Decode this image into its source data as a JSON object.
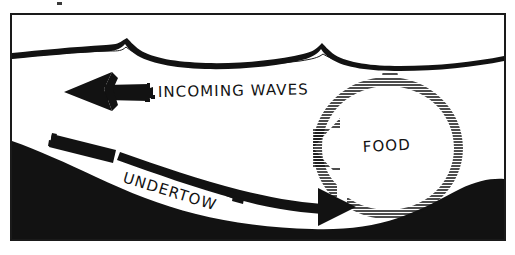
{
  "figure": {
    "medium": "black-and-white pen-and-ink line drawing",
    "background_color": "#ffffff",
    "ink_color": "#121212",
    "frame": {
      "name": "illustration-border",
      "style": "thin black rectangle outline",
      "x": 10,
      "y": 13,
      "width": 496,
      "height": 228,
      "stroke_color": "#1a1a1a",
      "stroke_width": 2
    },
    "speck": {
      "name": "scan-speck",
      "x": 57,
      "y": 2,
      "width": 5,
      "height": 3
    }
  },
  "labels": {
    "incoming_waves": "INCOMING WAVES",
    "undertow": "UNDERTOW",
    "food": "FOOD"
  },
  "label_positions": {
    "incoming_waves": {
      "x": 158,
      "y": 97,
      "rotation": -1,
      "font_size": 15
    },
    "undertow": {
      "x": 122,
      "y": 182,
      "rotation": 17,
      "font_size": 15
    },
    "food": {
      "x": 363,
      "y": 152,
      "rotation": -3,
      "font_size": 15
    }
  },
  "elements": {
    "water_surface": {
      "name": "water-surface-waves",
      "description": "Two peaked wave crests drawn as a heavy black brush line with a thin trailing line beneath",
      "crest_count": 2,
      "crest_x_positions": [
        125,
        322
      ],
      "baseline_y": 55,
      "color": "#121212"
    },
    "seabed": {
      "name": "seabed-silhouette",
      "description": "Solid black ocean floor sloping down from the left, dipping to a trough, then rising on the right",
      "fill_color": "#121212",
      "left_top_y": 142,
      "trough_y": 228,
      "right_rise_y": 188
    },
    "incoming_waves_arrow": {
      "name": "incoming-waves-arrow",
      "direction": "left",
      "description": "Thick black brush arrow pointing left, ragged tail",
      "tip_x": 66,
      "tail_x": 152,
      "y": 92,
      "color": "#121212"
    },
    "undertow_arrow": {
      "name": "undertow-arrow",
      "direction": "right",
      "description": "Long curving black brush arrow running along the seabed from upper-left to a solid triangular head at right",
      "tail_x": 52,
      "tip_x": 352,
      "tail_y": 138,
      "tip_y": 207,
      "color": "#121212"
    },
    "food_eddy": {
      "name": "food-eddy-hatching",
      "description": "Circulating ring drawn as stacked horizontal hatch strokes, open at lower right, with a leftward arrow point on its left flank, enclosing the word FOOD",
      "center_x": 388,
      "center_y": 148,
      "outer_radius_x": 66,
      "outer_radius_y": 62,
      "inner_radius_x": 34,
      "inner_radius_y": 32,
      "hatch_line_count": 44,
      "hatch_spacing_px": 3,
      "color": "#121212"
    }
  },
  "colors": {
    "ink": "#121212",
    "paper": "#ffffff",
    "frame": "#1a1a1a"
  }
}
